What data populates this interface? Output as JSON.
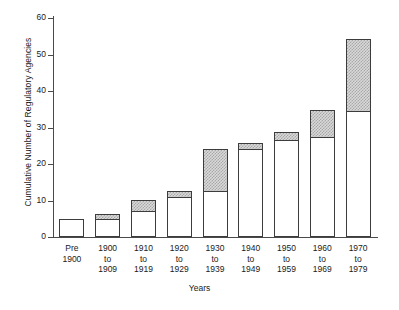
{
  "chart_data": {
    "type": "bar",
    "title": "",
    "subtitle": "",
    "xlabel": "Years",
    "ylabel": "Cumulative Number of Regulatory Agencies",
    "stacked": true,
    "grid": false,
    "legend": "none",
    "ylim": [
      0,
      60
    ],
    "yticks": [
      0,
      10,
      20,
      30,
      40,
      50,
      60
    ],
    "ytick_labels": [
      "0",
      "10",
      "20",
      "30",
      "40",
      "50",
      "60"
    ],
    "categories": [
      "Pre\n1900",
      "1900\nto\n1909",
      "1910\nto\n1919",
      "1920\nto\n1929",
      "1930\nto\n1939",
      "1940\nto\n1949",
      "1950\nto\n1959",
      "1960\nto\n1969",
      "1970\nto\n1979"
    ],
    "series": [
      {
        "name": "Prior cumulative total",
        "fill": "white",
        "values": [
          5,
          5,
          7,
          11,
          12.5,
          24,
          26.5,
          27.5,
          34.5
        ]
      },
      {
        "name": "Added in decade",
        "fill": "hatched",
        "values": [
          0,
          1.5,
          3.5,
          2,
          12,
          2,
          2.5,
          7.5,
          20
        ]
      }
    ],
    "totals": [
      5,
      6.5,
      10.5,
      13,
      24.5,
      26,
      29,
      35,
      54.5
    ],
    "colors": {
      "axis": "#4a4a4a",
      "bar_outline": "#3c3c3c",
      "bar_lower_fill": "#ffffff",
      "bar_upper_fill": "#d9d9d9",
      "hatch": "#a8a8a8",
      "background": "#ffffff",
      "text": "#1a1a1a"
    }
  }
}
